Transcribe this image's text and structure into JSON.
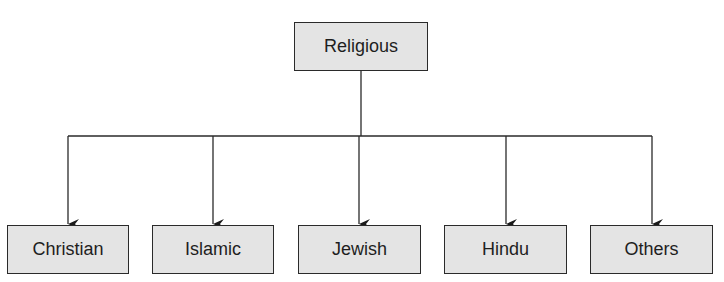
{
  "diagram": {
    "type": "hierarchy-tree",
    "root": {
      "label": "Religious"
    },
    "children": [
      {
        "label": "Christian"
      },
      {
        "label": "Islamic"
      },
      {
        "label": "Jewish"
      },
      {
        "label": "Hindu"
      },
      {
        "label": "Others"
      }
    ],
    "colors": {
      "box_fill": "#e4e4e4",
      "stroke": "#2a2a2a",
      "text": "#1e1e1e"
    }
  }
}
